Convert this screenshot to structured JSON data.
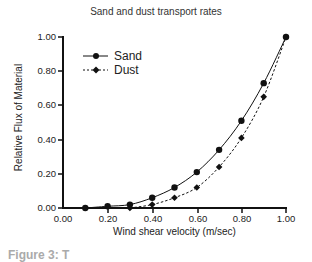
{
  "chart_data": {
    "type": "line",
    "title": "Sand and dust transport rates",
    "xlabel": "Wind shear velocity (m/sec)",
    "ylabel": "Relative Flux of Material",
    "xlim": [
      0,
      1.0
    ],
    "ylim": [
      0,
      1.0
    ],
    "x_ticks": [
      "0.00",
      "0.20",
      "0.40",
      "0.60",
      "0.80",
      "1.00"
    ],
    "y_ticks": [
      "0.00",
      "0.20",
      "0.40",
      "0.60",
      "0.80",
      "1.00"
    ],
    "grid": false,
    "legend_position": "upper-left",
    "series": [
      {
        "name": "Sand",
        "marker": "circle",
        "line": "solid",
        "x": [
          0.1,
          0.2,
          0.3,
          0.4,
          0.5,
          0.6,
          0.7,
          0.8,
          0.9,
          1.0
        ],
        "values": [
          0.0,
          0.01,
          0.02,
          0.06,
          0.12,
          0.21,
          0.34,
          0.51,
          0.73,
          1.0
        ]
      },
      {
        "name": "Dust",
        "marker": "diamond",
        "line": "dashed",
        "x": [
          0.3,
          0.4,
          0.5,
          0.6,
          0.7,
          0.8,
          0.9,
          1.0
        ],
        "values": [
          0.0,
          0.02,
          0.06,
          0.12,
          0.24,
          0.41,
          0.65,
          1.0
        ]
      }
    ]
  },
  "caption_partial": "Figure 3: T"
}
